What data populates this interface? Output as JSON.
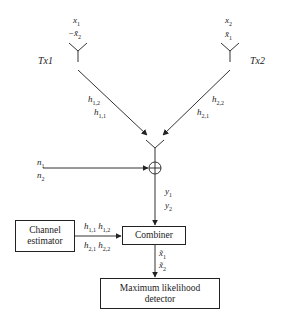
{
  "diagram": {
    "type": "Alamouti STBC 2x1 receiver block diagram",
    "transmitters": [
      {
        "name": "Tx1",
        "symbols": [
          "x1",
          "-x̄2"
        ]
      },
      {
        "name": "Tx2",
        "symbols": [
          "x2",
          "x̄1"
        ]
      }
    ],
    "channels": {
      "tx1_labels": [
        "h1,2",
        "h1,1"
      ],
      "tx2_labels": [
        "h2,2",
        "h2,1"
      ]
    },
    "noise": [
      "n1",
      "n2"
    ],
    "received": [
      "y1",
      "y2"
    ],
    "channel_estimates": {
      "row1": "h1,1 h1,2",
      "row2": "h2,1 h2,2"
    },
    "combined": [
      "x̃1",
      "x̃2"
    ],
    "blocks": {
      "channel_estimator": "Channel estimator",
      "channel_estimator_line1": "Channel",
      "channel_estimator_line2": "estimator",
      "combiner": "Combiner",
      "ml_detector_line1": "Maximum likelihood",
      "ml_detector_line2": "detector"
    }
  },
  "colors": {
    "line": "#222222",
    "background": "#ffffff"
  }
}
